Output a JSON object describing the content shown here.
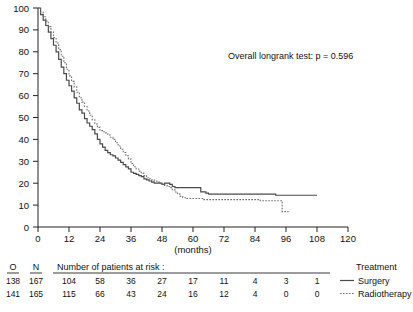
{
  "chart_data": {
    "type": "line",
    "title": "",
    "xlabel": "(months)",
    "ylabel": "",
    "xlim": [
      0,
      120
    ],
    "ylim": [
      0,
      100
    ],
    "grid": false,
    "legend_position": "bottom-right",
    "x_ticks": [
      "0",
      "12",
      "24",
      "36",
      "48",
      "60",
      "72",
      "84",
      "96",
      "108",
      "120"
    ],
    "y_ticks": [
      "0",
      "10",
      "20",
      "30",
      "40",
      "50",
      "60",
      "70",
      "80",
      "90",
      "100"
    ],
    "annotation": "Overall longrank test: p = 0.596",
    "series": [
      {
        "name": "Surgery",
        "style": "solid",
        "color": "#4a4a4a",
        "points": [
          [
            0,
            100
          ],
          [
            1,
            97
          ],
          [
            2,
            94.5
          ],
          [
            3,
            92
          ],
          [
            4,
            89
          ],
          [
            5,
            86
          ],
          [
            6,
            83
          ],
          [
            7,
            80
          ],
          [
            8,
            76.5
          ],
          [
            9,
            73
          ],
          [
            10,
            70
          ],
          [
            11,
            67
          ],
          [
            12,
            64.5
          ],
          [
            13,
            62
          ],
          [
            14,
            59
          ],
          [
            15,
            56.5
          ],
          [
            16,
            53.5
          ],
          [
            17,
            52
          ],
          [
            18,
            49.5
          ],
          [
            19,
            47.5
          ],
          [
            20,
            46
          ],
          [
            21,
            44.5
          ],
          [
            22,
            42.5
          ],
          [
            23,
            40
          ],
          [
            24,
            38
          ],
          [
            25,
            36.5
          ],
          [
            26,
            35
          ],
          [
            27,
            34
          ],
          [
            28,
            33
          ],
          [
            29,
            32.5
          ],
          [
            30,
            31.5
          ],
          [
            31,
            30.5
          ],
          [
            32,
            29.5
          ],
          [
            33,
            28.5
          ],
          [
            34,
            27.5
          ],
          [
            35,
            26.5
          ],
          [
            36,
            25
          ],
          [
            37,
            24.5
          ],
          [
            38,
            24
          ],
          [
            39,
            23.5
          ],
          [
            40,
            23
          ],
          [
            41,
            22
          ],
          [
            42,
            21.5
          ],
          [
            43,
            21
          ],
          [
            44,
            20.5
          ],
          [
            45,
            20
          ],
          [
            46,
            20
          ],
          [
            47,
            20
          ],
          [
            48,
            19.5
          ],
          [
            49,
            20
          ],
          [
            50,
            20
          ],
          [
            51,
            19.5
          ],
          [
            52,
            18.5
          ],
          [
            53,
            18
          ],
          [
            54,
            18
          ],
          [
            55,
            18
          ],
          [
            56,
            18
          ],
          [
            57,
            18
          ],
          [
            58,
            18
          ],
          [
            59,
            18
          ],
          [
            60,
            18
          ],
          [
            61,
            18
          ],
          [
            62,
            18
          ],
          [
            63,
            16
          ],
          [
            64,
            16
          ],
          [
            65,
            15.5
          ],
          [
            66,
            15
          ],
          [
            67,
            15
          ],
          [
            80,
            15
          ],
          [
            84,
            15
          ],
          [
            92,
            14.5
          ],
          [
            96,
            14.5
          ],
          [
            104,
            14.5
          ],
          [
            108,
            14.5
          ]
        ]
      },
      {
        "name": "Radiotherapy",
        "style": "dotted",
        "color": "#6e6e6e",
        "points": [
          [
            0,
            100
          ],
          [
            1,
            98
          ],
          [
            2,
            96
          ],
          [
            3,
            94
          ],
          [
            4,
            91.5
          ],
          [
            5,
            89
          ],
          [
            6,
            86.5
          ],
          [
            7,
            84
          ],
          [
            8,
            81
          ],
          [
            9,
            78
          ],
          [
            10,
            75
          ],
          [
            11,
            72
          ],
          [
            12,
            69
          ],
          [
            13,
            66.5
          ],
          [
            14,
            64
          ],
          [
            15,
            61.5
          ],
          [
            16,
            59
          ],
          [
            17,
            57
          ],
          [
            18,
            55
          ],
          [
            19,
            53
          ],
          [
            20,
            51
          ],
          [
            21,
            49
          ],
          [
            22,
            47
          ],
          [
            23,
            45.5
          ],
          [
            24,
            44
          ],
          [
            25,
            43.5
          ],
          [
            26,
            43
          ],
          [
            27,
            42
          ],
          [
            28,
            41
          ],
          [
            29,
            40
          ],
          [
            30,
            38.5
          ],
          [
            31,
            37
          ],
          [
            32,
            35.5
          ],
          [
            33,
            34
          ],
          [
            34,
            32.5
          ],
          [
            35,
            31
          ],
          [
            36,
            29
          ],
          [
            37,
            27.5
          ],
          [
            38,
            26.5
          ],
          [
            39,
            25.5
          ],
          [
            40,
            24.5
          ],
          [
            41,
            23.5
          ],
          [
            42,
            22.5
          ],
          [
            43,
            22
          ],
          [
            44,
            21.5
          ],
          [
            45,
            21
          ],
          [
            46,
            20.5
          ],
          [
            47,
            20
          ],
          [
            48,
            19.5
          ],
          [
            49,
            19
          ],
          [
            50,
            18.5
          ],
          [
            51,
            18
          ],
          [
            52,
            17
          ],
          [
            53,
            16
          ],
          [
            54,
            15
          ],
          [
            55,
            14
          ],
          [
            56,
            13.5
          ],
          [
            57,
            13
          ],
          [
            58,
            13
          ],
          [
            60,
            13
          ],
          [
            64,
            12.5
          ],
          [
            70,
            12.5
          ],
          [
            78,
            12.5
          ],
          [
            86,
            12
          ],
          [
            92,
            12
          ],
          [
            94,
            12
          ],
          [
            94.5,
            7
          ],
          [
            96,
            7
          ],
          [
            97,
            7
          ]
        ]
      }
    ]
  },
  "risk_table": {
    "col_o_header": "O",
    "col_n_header": "N",
    "title": "Number of patients at risk :",
    "treatment_header": "Treatment",
    "x_positions": [
      12,
      24,
      36,
      48,
      60,
      72,
      84,
      96,
      108
    ],
    "rows": [
      {
        "o": "138",
        "n": "167",
        "label": "Surgery",
        "style": "solid",
        "counts": [
          "104",
          "58",
          "36",
          "27",
          "17",
          "11",
          "4",
          "3",
          "1"
        ]
      },
      {
        "o": "141",
        "n": "165",
        "label": "Radiotherapy",
        "style": "dotted",
        "counts": [
          "115",
          "66",
          "43",
          "24",
          "16",
          "12",
          "4",
          "0",
          "0"
        ]
      }
    ]
  }
}
